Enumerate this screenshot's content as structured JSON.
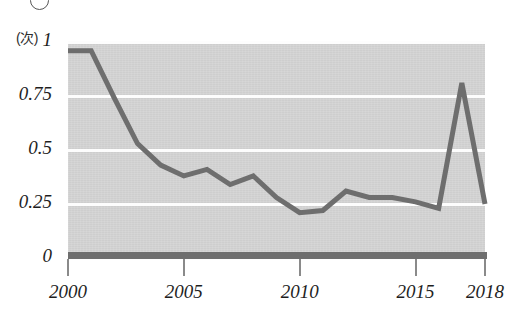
{
  "header": {
    "cropped_text": "",
    "bullet_icon": "circle-icon"
  },
  "axes": {
    "y_unit_label": "(次)",
    "y_ticks": [
      "1",
      "0.75",
      "0.5",
      "0.25",
      "0"
    ],
    "x_ticks": [
      "2000",
      "2005",
      "2010",
      "2015",
      "2018"
    ]
  },
  "colors": {
    "plot_background": "#d5d5d5",
    "gridline": "#fdfdfd",
    "series_line": "#6e6e6e",
    "axis": "#6e6e6e",
    "text": "#1e1e1e"
  },
  "chart_data": {
    "type": "line",
    "title": "",
    "xlabel": "",
    "ylabel": "(次)",
    "xlim": [
      2000,
      2018
    ],
    "ylim": [
      0,
      1
    ],
    "grid": true,
    "legend": "none",
    "y_tick_values": [
      0,
      0.25,
      0.5,
      0.75,
      1
    ],
    "x_tick_values": [
      2000,
      2005,
      2010,
      2015,
      2018
    ],
    "x": [
      2000,
      2001,
      2002,
      2003,
      2004,
      2005,
      2006,
      2007,
      2008,
      2009,
      2010,
      2011,
      2012,
      2013,
      2014,
      2015,
      2016,
      2017,
      2018
    ],
    "series": [
      {
        "name": "値",
        "values": [
          0.96,
          0.96,
          0.74,
          0.53,
          0.43,
          0.38,
          0.41,
          0.34,
          0.38,
          0.28,
          0.21,
          0.22,
          0.31,
          0.28,
          0.28,
          0.26,
          0.23,
          0.81,
          0.25
        ]
      }
    ]
  }
}
